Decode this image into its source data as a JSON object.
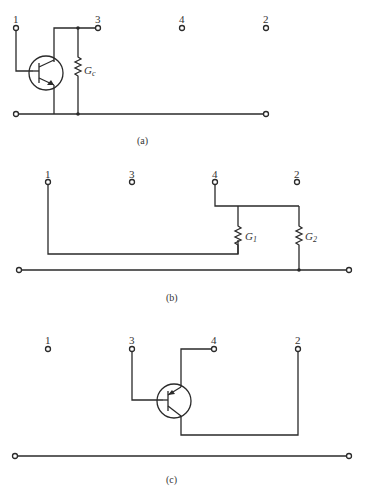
{
  "figure": {
    "panels": [
      {
        "caption": "(a)",
        "terminals": [
          "1",
          "3",
          "4",
          "2"
        ],
        "components": [
          {
            "type": "npn-transistor"
          },
          {
            "type": "resistor",
            "label": "G",
            "subscript": "c"
          }
        ]
      },
      {
        "caption": "(b)",
        "terminals": [
          "1",
          "3",
          "4",
          "2"
        ],
        "components": [
          {
            "type": "resistor",
            "label": "G",
            "subscript": "1"
          },
          {
            "type": "resistor",
            "label": "G",
            "subscript": "2"
          }
        ]
      },
      {
        "caption": "(c)",
        "terminals": [
          "1",
          "3",
          "4",
          "2"
        ],
        "components": [
          {
            "type": "pnp-transistor"
          }
        ]
      }
    ]
  }
}
